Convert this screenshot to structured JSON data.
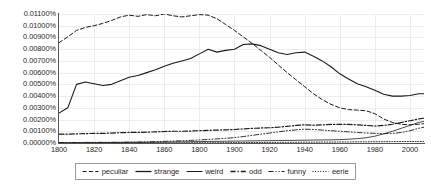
{
  "chart_data": {
    "type": "line",
    "title": "",
    "xlabel": "",
    "ylabel": "",
    "xlim": [
      1800,
      2008
    ],
    "ylim": [
      0,
      0.011
    ],
    "grid": true,
    "legend_position": "bottom",
    "y_tick_labels": [
      "0.01100%",
      "0.01000%",
      "0.00900%",
      "0.00800%",
      "0.00700%",
      "0.00600%",
      "0.00500%",
      "0.00400%",
      "0.00300%",
      "0.00200%",
      "0.00100%",
      "0.00000%"
    ],
    "y_tick_values": [
      0.011,
      0.01,
      0.009,
      0.008,
      0.007,
      0.006,
      0.005,
      0.004,
      0.003,
      0.002,
      0.001,
      0.0
    ],
    "x_tick_labels": [
      "1800",
      "1820",
      "1840",
      "1860",
      "1800",
      "1900",
      "1920",
      "1940",
      "1960",
      "1980",
      "2000"
    ],
    "x_tick_values": [
      1800,
      1820,
      1840,
      1860,
      1880,
      1900,
      1920,
      1940,
      1960,
      1980,
      2000
    ],
    "x": [
      1800,
      1805,
      1810,
      1815,
      1820,
      1825,
      1830,
      1835,
      1840,
      1845,
      1850,
      1855,
      1860,
      1865,
      1870,
      1875,
      1880,
      1885,
      1890,
      1895,
      1900,
      1905,
      1910,
      1915,
      1920,
      1925,
      1930,
      1935,
      1940,
      1945,
      1950,
      1955,
      1960,
      1965,
      1970,
      1975,
      1980,
      1985,
      1990,
      1995,
      2000,
      2005,
      2008
    ],
    "series": [
      {
        "name": "peculiar",
        "style": "dashed",
        "values": [
          0.00855,
          0.00905,
          0.0096,
          0.00985,
          0.01,
          0.0102,
          0.01045,
          0.01075,
          0.0109,
          0.0108,
          0.01095,
          0.01085,
          0.011,
          0.01085,
          0.01075,
          0.01085,
          0.01095,
          0.0109,
          0.0106,
          0.0101,
          0.0096,
          0.00905,
          0.0085,
          0.0079,
          0.0073,
          0.00665,
          0.006,
          0.0054,
          0.0048,
          0.0042,
          0.0037,
          0.0033,
          0.003,
          0.00285,
          0.0028,
          0.00275,
          0.0025,
          0.00205,
          0.00175,
          0.0016,
          0.00155,
          0.0016,
          0.00165
        ]
      },
      {
        "name": "strange",
        "style": "solid",
        "values": [
          0.00255,
          0.003,
          0.005,
          0.0052,
          0.00505,
          0.0049,
          0.005,
          0.0053,
          0.0056,
          0.00575,
          0.006,
          0.00625,
          0.00655,
          0.0068,
          0.007,
          0.0072,
          0.0076,
          0.008,
          0.00775,
          0.0079,
          0.008,
          0.0084,
          0.00845,
          0.0083,
          0.008,
          0.0077,
          0.00755,
          0.0077,
          0.00775,
          0.0074,
          0.007,
          0.0065,
          0.0059,
          0.00545,
          0.00505,
          0.0048,
          0.0045,
          0.00415,
          0.004,
          0.004,
          0.00405,
          0.0042,
          0.0042
        ]
      },
      {
        "name": "weird",
        "style": "solid-thin",
        "values": [
          2e-05,
          2e-05,
          2e-05,
          3e-05,
          3e-05,
          3e-05,
          4e-05,
          4e-05,
          5e-05,
          5e-05,
          6e-05,
          7e-05,
          8e-05,
          9e-05,
          0.0001,
          0.00011,
          0.00012,
          0.00013,
          0.00014,
          0.00015,
          0.00016,
          0.00017,
          0.00018,
          0.00019,
          0.0002,
          0.00021,
          0.00022,
          0.00023,
          0.00024,
          0.00025,
          0.00026,
          0.00027,
          0.00029,
          0.00032,
          0.00037,
          0.00045,
          0.00058,
          0.00078,
          0.001,
          0.00125,
          0.0015,
          0.00175,
          0.00185
        ]
      },
      {
        "name": "odd",
        "style": "dash-dot",
        "values": [
          0.00075,
          0.00075,
          0.00078,
          0.0008,
          0.00082,
          0.00082,
          0.00085,
          0.00088,
          0.0009,
          0.0009,
          0.00092,
          0.00095,
          0.00098,
          0.001,
          0.001,
          0.00102,
          0.00105,
          0.00108,
          0.0011,
          0.00112,
          0.00115,
          0.0012,
          0.00125,
          0.00128,
          0.0013,
          0.00135,
          0.00142,
          0.0015,
          0.00155,
          0.00152,
          0.00155,
          0.00158,
          0.0016,
          0.00158,
          0.00155,
          0.0015,
          0.00145,
          0.0015,
          0.0016,
          0.00175,
          0.0019,
          0.00205,
          0.00212
        ]
      },
      {
        "name": "funny",
        "style": "dash-dot-dot",
        "values": [
          4e-05,
          4e-05,
          4e-05,
          5e-05,
          5e-05,
          6e-05,
          6e-05,
          7e-05,
          8e-05,
          9e-05,
          0.0001,
          0.00012,
          0.00014,
          0.00016,
          0.00019,
          0.00022,
          0.00026,
          0.0003,
          0.00035,
          0.0004,
          0.00046,
          0.00055,
          0.00065,
          0.00075,
          0.00085,
          0.00095,
          0.00105,
          0.00112,
          0.00118,
          0.00115,
          0.0011,
          0.00105,
          0.001,
          0.00095,
          0.0009,
          0.00085,
          0.00082,
          0.0008,
          0.00082,
          0.0009,
          0.00105,
          0.00125,
          0.00135
        ]
      },
      {
        "name": "eerie",
        "style": "dotted",
        "values": [
          0.0,
          0.0,
          0.0,
          0.0,
          0.0,
          0.0,
          0.0,
          0.0,
          0.0,
          0.0,
          1e-05,
          1e-05,
          1e-05,
          1e-05,
          1e-05,
          2e-05,
          2e-05,
          2e-05,
          2e-05,
          3e-05,
          3e-05,
          3e-05,
          4e-05,
          4e-05,
          5e-05,
          5e-05,
          6e-05,
          6e-05,
          7e-05,
          7e-05,
          8e-05,
          8e-05,
          9e-05,
          9e-05,
          0.0001,
          0.0001,
          0.00011,
          0.00011,
          0.00012,
          0.00012,
          0.00013,
          0.00013,
          0.00013
        ]
      }
    ],
    "legend": [
      {
        "label": "peculiar",
        "style": "dashed"
      },
      {
        "label": "strange",
        "style": "solid"
      },
      {
        "label": "weird",
        "style": "solid-thin"
      },
      {
        "label": "odd",
        "style": "dash-dot"
      },
      {
        "label": "funny",
        "style": "dash-dot-dot"
      },
      {
        "label": "eerie",
        "style": "dotted"
      }
    ],
    "colors": {
      "line": "#1a1a1a",
      "grid": "#ececec",
      "axis": "#555555",
      "background": "#ffffff"
    }
  }
}
